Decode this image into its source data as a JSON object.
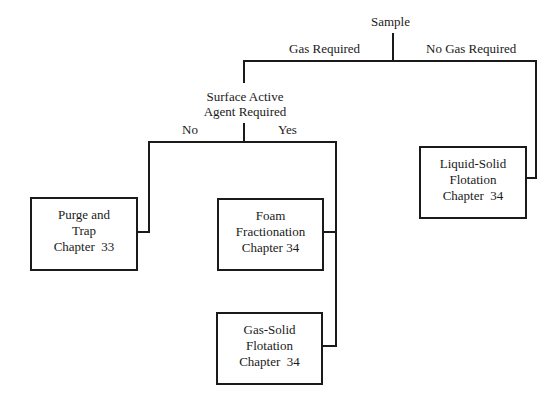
{
  "root": {
    "label": "Sample"
  },
  "branches": {
    "left": "Gas Required",
    "right": "No Gas Required"
  },
  "decision": {
    "line1": "Surface Active",
    "line2": "Agent Required",
    "no": "No",
    "yes": "Yes"
  },
  "boxes": [
    {
      "line1": "Purge and",
      "line2": "Trap",
      "line3": "Chapter  33"
    },
    {
      "line1": "Foam",
      "line2": "Fractionation",
      "line3": "Chapter 34"
    },
    {
      "line1": "Gas-Solid",
      "line2": "Flotation",
      "line3": "Chapter  34"
    },
    {
      "line1": "Liquid-Solid",
      "line2": "Flotation",
      "line3": "Chapter  34"
    }
  ]
}
